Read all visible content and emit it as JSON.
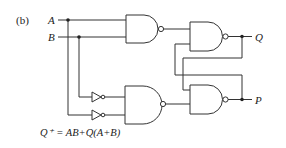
{
  "figure": {
    "panel_label": "(b)",
    "inputs": [
      {
        "name": "A"
      },
      {
        "name": "B"
      }
    ],
    "outputs": [
      {
        "name": "Q"
      },
      {
        "name": "P"
      }
    ],
    "gates": [
      {
        "id": "nand-1",
        "type": "NAND",
        "inputs": [
          "A",
          "B"
        ]
      },
      {
        "id": "nand-2",
        "type": "NAND",
        "inputs": [
          "nand-1",
          "P"
        ],
        "output": "Q"
      },
      {
        "id": "not-1",
        "type": "NOT",
        "input": "B"
      },
      {
        "id": "not-2",
        "type": "NOT",
        "input": "A"
      },
      {
        "id": "nand-3",
        "type": "NAND",
        "inputs": [
          "not-1",
          "not-2"
        ]
      },
      {
        "id": "nand-4",
        "type": "NAND",
        "inputs": [
          "Q",
          "nand-3"
        ],
        "output": "P"
      }
    ],
    "equation": "Q⁺ = AB+Q(A+B)"
  }
}
